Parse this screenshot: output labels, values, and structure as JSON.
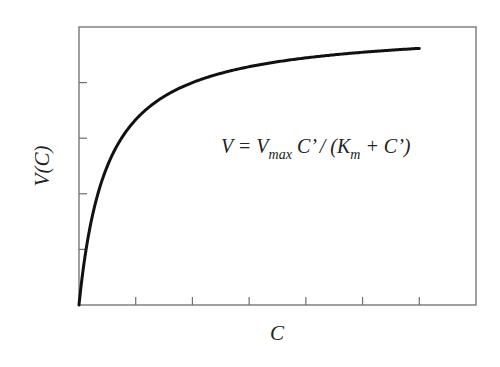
{
  "chart_data": {
    "type": "line",
    "title": "",
    "xlabel": "C",
    "ylabel": "V(C)",
    "annotation": {
      "parts": [
        {
          "text": "V = V",
          "sub": false
        },
        {
          "text": "max",
          "sub": true
        },
        {
          "text": " C’ / (K",
          "sub": false
        },
        {
          "text": "m",
          "sub": true
        },
        {
          "text": " + C’)",
          "sub": false
        }
      ]
    },
    "model": {
      "form": "V = Vmax*C/(Km + C)",
      "Vmax": 5,
      "Km": 0.5
    },
    "xlim": [
      0,
      7
    ],
    "ylim": [
      0,
      5
    ],
    "x_ticks": [
      0,
      1,
      2,
      3,
      4,
      5,
      6,
      7
    ],
    "y_ticks": [
      0,
      1,
      2,
      3,
      4,
      5
    ],
    "tick_labels_shown": false,
    "grid": false,
    "legend": null,
    "series": [
      {
        "name": "V(C)",
        "color": "#111111",
        "x": [
          0,
          0.05,
          0.1,
          0.2,
          0.3,
          0.4,
          0.5,
          0.75,
          1,
          1.25,
          1.5,
          2,
          2.5,
          3,
          3.5,
          4,
          4.5,
          5,
          5.5,
          6
        ],
        "values": [
          0,
          0.45,
          0.83,
          1.43,
          1.88,
          2.22,
          2.5,
          3.0,
          3.33,
          3.57,
          3.75,
          4.0,
          4.17,
          4.29,
          4.38,
          4.44,
          4.5,
          4.55,
          4.58,
          4.62
        ]
      }
    ]
  },
  "frame": {
    "left": 79,
    "top": 27,
    "right": 476,
    "bottom": 305,
    "color": "#6e6e6e"
  }
}
